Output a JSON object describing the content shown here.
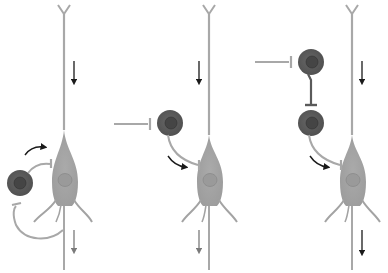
{
  "diagram": {
    "type": "neural-circuit-motifs",
    "colors": {
      "background": "#ffffff",
      "principal_neuron": "#a3a3a3",
      "principal_nucleus": "#8f8f8f",
      "interneuron": "#5a5a5a",
      "interneuron_nucleus": "#3d3d3d",
      "connection_line": "#a8a8a8",
      "arrow": "#1a1a1a",
      "output_arrow": "#7a7a7a"
    },
    "panels": [
      {
        "id": "feedback",
        "principal_neuron": {
          "x": 66,
          "soma_y": 182
        },
        "interneurons": [
          {
            "x": 25,
            "y": 183
          }
        ],
        "flow_arrows": [
          "down-top",
          "down-bottom",
          "curved-to-principal"
        ],
        "external_input": false
      },
      {
        "id": "feedforward",
        "principal_neuron": {
          "x": 210,
          "soma_y": 182
        },
        "interneurons": [
          {
            "x": 170,
            "y": 124
          }
        ],
        "flow_arrows": [
          "down-top",
          "down-bottom",
          "curved-to-principal"
        ],
        "external_input": true
      },
      {
        "id": "disinhibition",
        "principal_neuron": {
          "x": 353,
          "soma_y": 182
        },
        "interneurons": [
          {
            "x": 312,
            "y": 62
          },
          {
            "x": 312,
            "y": 123
          }
        ],
        "flow_arrows": [
          "down-top",
          "down-bottom",
          "curved-to-principal"
        ],
        "external_input": true
      }
    ]
  }
}
